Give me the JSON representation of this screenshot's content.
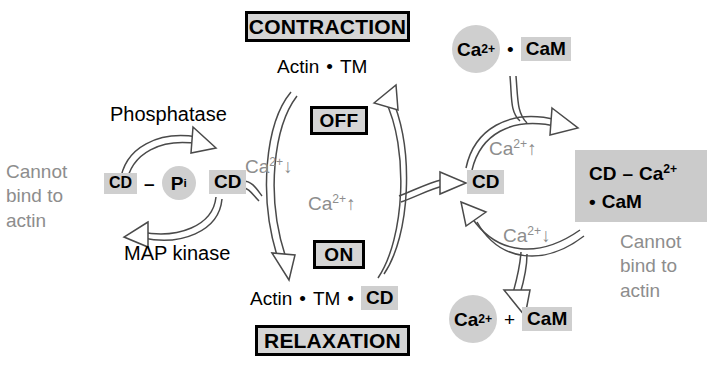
{
  "diagram": {
    "colors": {
      "background": "#ffffff",
      "chip_gray": "#cfcfcf",
      "block_gray": "#cbcbcb",
      "state_box_fill": "#d5d5d5",
      "annotation_gray": "#8d8d8d",
      "stroke": "#3a3a3a",
      "text": "#000000"
    }
  },
  "left_cycle": {
    "annotation": "Cannot\nbind to\nactin",
    "annotation_lines": [
      "Cannot",
      "bind to",
      "actin"
    ],
    "substrate": {
      "cd_label": "CD",
      "dash": "–",
      "pi_label": "P",
      "pi_subscript": "i"
    },
    "product": {
      "cd_label": "CD"
    },
    "forward_enzyme": "Phosphatase",
    "reverse_enzyme": "MAP kinase"
  },
  "center_cycle": {
    "top_state": "CONTRACTION",
    "top_complex_prefix": "Actin",
    "top_complex_bullet": "•",
    "top_complex_suffix": "TM",
    "off_label": "OFF",
    "on_label": "ON",
    "bottom_state": "RELAXATION",
    "bottom_complex_prefix": "Actin",
    "bottom_complex_mid": "TM",
    "bottom_complex_chip": "CD",
    "bullet": "•",
    "left_arrow_label": "Ca",
    "left_arrow_label_sup": "2+",
    "left_arrow_label_arrow": "↓",
    "right_arrow_label": "Ca",
    "right_arrow_label_sup": "2+",
    "right_arrow_label_arrow": "↑"
  },
  "right_cycle": {
    "input": {
      "ca_label": "Ca",
      "ca_sup": "2+",
      "bullet": "•",
      "cam_label": "CaM"
    },
    "hub": {
      "cd_label": "CD"
    },
    "complex": {
      "line1_cd": "CD",
      "line1_dash": "–",
      "line1_ca": "Ca",
      "line1_sup": "2+",
      "line2_bullet": "•",
      "line2_cam": "CaM"
    },
    "complex_annotation_lines": [
      "Cannot",
      "bind to",
      "actin"
    ],
    "output": {
      "ca_label": "Ca",
      "ca_sup": "2+",
      "plus": "+",
      "cam_label": "CaM"
    },
    "up_arrow_label": "Ca",
    "up_arrow_sup": "2+",
    "up_arrow_dir": "↑",
    "down_arrow_label": "Ca",
    "down_arrow_sup": "2+",
    "down_arrow_dir": "↓"
  }
}
